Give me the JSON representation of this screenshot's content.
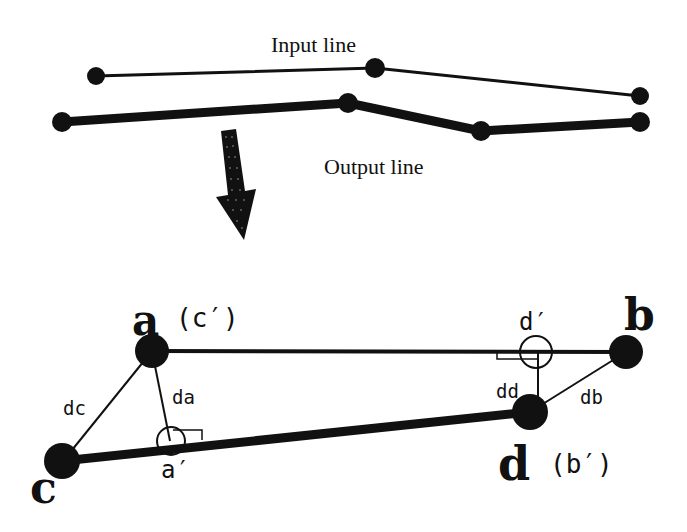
{
  "colors": {
    "ink": "#111111",
    "background": "#ffffff"
  },
  "top": {
    "input_label": "Input line",
    "output_label": "Output line",
    "input_line": [
      [
        96,
        76
      ],
      [
        375,
        68
      ],
      [
        640,
        96
      ]
    ],
    "output_line": [
      [
        62,
        122
      ],
      [
        348,
        103
      ],
      [
        481,
        131
      ],
      [
        640,
        122
      ]
    ]
  },
  "arrow": {
    "icon": "down-arrow-icon",
    "direction": "down"
  },
  "bottom": {
    "points": {
      "a": {
        "label": "a",
        "alias": "(c′)",
        "x": 152,
        "y": 351
      },
      "b": {
        "label": "b",
        "x": 626,
        "y": 352
      },
      "c": {
        "label": "c",
        "x": 62,
        "y": 461
      },
      "d": {
        "label": "d",
        "alias": "(b′)",
        "x": 530,
        "y": 412
      }
    },
    "projections": {
      "a_prime": {
        "label": "a′",
        "x": 170,
        "y": 441
      },
      "d_prime": {
        "label": "d′",
        "x": 535,
        "y": 352
      }
    },
    "distances": {
      "dc": "dc",
      "da": "da",
      "dd": "dd",
      "db": "db"
    }
  }
}
